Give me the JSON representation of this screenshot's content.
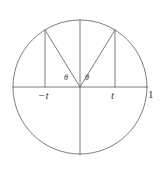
{
  "figure": {
    "kind": "unit-circle-geometry-diagram",
    "width": 164,
    "height": 175,
    "background_color": "#ffffff",
    "stroke_color": "#6e6e6e",
    "text_color": "#3a3a3a"
  },
  "geometry": {
    "circle": {
      "center_x": 80,
      "center_y": 87,
      "radius": 67
    },
    "horizontal_axis": {
      "x1": 13,
      "y1": 87,
      "x2": 147,
      "y2": 87
    },
    "vertical_axis": {
      "x1": 80,
      "y1": 20,
      "x2": 80,
      "y2": 155
    },
    "left_chord": {
      "x1": 45,
      "y1": 87,
      "x2": 45,
      "y2": 30
    },
    "right_chord": {
      "x1": 115,
      "y1": 87,
      "x2": 115,
      "y2": 30
    },
    "left_radius": {
      "x1": 80,
      "y1": 87,
      "x2": 45,
      "y2": 30
    },
    "right_radius": {
      "x1": 80,
      "y1": 87,
      "x2": 115,
      "y2": 30
    }
  },
  "labels": {
    "negative_t": "−t",
    "positive_t": "t",
    "unit_radius": "1",
    "theta_left": "θ",
    "theta_right": "θ"
  },
  "chart_data": {
    "type": "scatter",
    "title": "",
    "xlabel": "",
    "ylabel": "",
    "xlim": [
      -1,
      1
    ],
    "ylim": [
      -1,
      1
    ],
    "grid": false,
    "legend": false,
    "annotations": [
      {
        "text": "−t",
        "x": -0.52,
        "y": -0.13
      },
      {
        "text": "t",
        "x": 0.52,
        "y": -0.13
      },
      {
        "text": "1",
        "x": 1.05,
        "y": -0.1
      },
      {
        "text": "θ",
        "x": -0.17,
        "y": 0.14
      },
      {
        "text": "θ",
        "x": 0.12,
        "y": 0.14
      }
    ],
    "points": [
      {
        "name": "left-point",
        "x": -0.52,
        "y": 0.85
      },
      {
        "name": "right-point",
        "x": 0.52,
        "y": 0.85
      },
      {
        "name": "origin",
        "x": 0,
        "y": 0
      },
      {
        "name": "right-unit",
        "x": 1,
        "y": 0
      },
      {
        "name": "left-unit",
        "x": -1,
        "y": 0
      },
      {
        "name": "top-unit",
        "x": 0,
        "y": 1
      },
      {
        "name": "bottom-unit",
        "x": 0,
        "y": -1
      }
    ]
  }
}
